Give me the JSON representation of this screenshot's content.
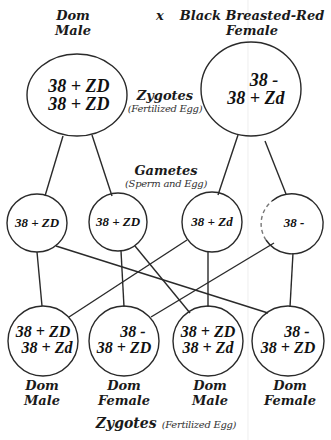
{
  "parents": {
    "cross_symbol": "x",
    "male": {
      "label_line1": "Dom",
      "label_line2": "Male",
      "genotype_line1": "38 + ZD",
      "genotype_line2": "38 + ZD"
    },
    "female": {
      "label_line1": "Black Breasted-Red",
      "label_line2": "Female",
      "genotype_line1": "38 -",
      "genotype_line2": "38 + Zd"
    }
  },
  "zygotes_top_label": {
    "title": "Zygotes",
    "subtitle": "(Fertilized Egg)"
  },
  "gametes_label": {
    "title": "Gametes",
    "subtitle": "(Sperm and Egg)"
  },
  "gametes": [
    {
      "genotype": "38 + ZD"
    },
    {
      "genotype": "38 + ZD"
    },
    {
      "genotype": "38 + Zd"
    },
    {
      "genotype": "38 -"
    }
  ],
  "offspring": [
    {
      "genotype_line1": "38 + ZD",
      "genotype_line2": "38 + Zd",
      "label_line1": "Dom",
      "label_line2": "Male"
    },
    {
      "genotype_line1": "38 -",
      "genotype_line2": "38 + ZD",
      "label_line1": "Dom",
      "label_line2": "Female"
    },
    {
      "genotype_line1": "38 + ZD",
      "genotype_line2": "38 + Zd",
      "label_line1": "Dom",
      "label_line2": "Male"
    },
    {
      "genotype_line1": "38 -",
      "genotype_line2": "38 + ZD",
      "label_line1": "Dom",
      "label_line2": "Female"
    }
  ],
  "zygotes_bottom_label": {
    "title": "Zygotes",
    "subtitle": "(Fertilized Egg)"
  },
  "colors": {
    "stroke": "#2a2a2a",
    "text": "#111111",
    "background": "#ffffff"
  }
}
